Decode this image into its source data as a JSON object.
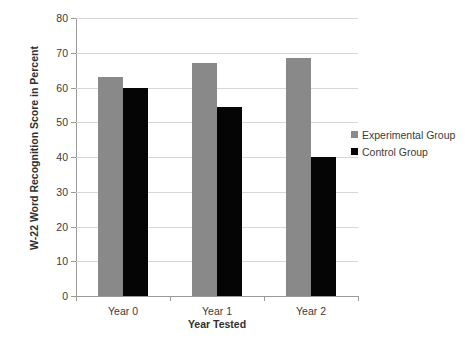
{
  "chart_data": {
    "type": "bar",
    "title": "",
    "xlabel": "Year Tested",
    "ylabel": "W-22 Word Recognition Score in Percent",
    "categories": [
      "Year 0",
      "Year 1",
      "Year 2"
    ],
    "series": [
      {
        "name": "Experimental Group",
        "color": "#898989",
        "values": [
          63,
          67,
          68.5
        ]
      },
      {
        "name": "Control Group",
        "color": "#050505",
        "values": [
          60,
          54.5,
          40
        ]
      }
    ],
    "ylim": [
      0,
      80
    ],
    "ytick_step": 10,
    "yticks": [
      "0",
      "10",
      "20",
      "30",
      "40",
      "50",
      "60",
      "70",
      "80"
    ],
    "grid": "horizontal",
    "legend_position": "right"
  },
  "legend": {
    "items": [
      {
        "label": "Experimental Group"
      },
      {
        "label": "Control Group"
      }
    ]
  }
}
